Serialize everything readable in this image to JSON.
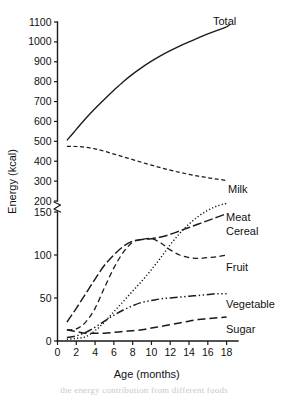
{
  "chart_data": {
    "type": "line",
    "title": "",
    "xlabel": "Age (months)",
    "ylabel": "Energy (kcal)",
    "xlim": [
      0,
      19
    ],
    "xticks": [
      0,
      2,
      4,
      6,
      8,
      10,
      12,
      14,
      16,
      18
    ],
    "xtick_labels": [
      "0",
      "2",
      "4",
      "6",
      "8",
      "10",
      "12",
      "14",
      "16",
      "18"
    ],
    "ylim_lower": [
      0,
      150
    ],
    "ylim_upper": [
      200,
      1100
    ],
    "yticks_lower": [
      0,
      50,
      100,
      150
    ],
    "yticks_upper": [
      200,
      300,
      400,
      500,
      600,
      700,
      800,
      900,
      1000,
      1100
    ],
    "ytick_labels": [
      "0",
      "50",
      "100",
      "150",
      "200",
      "300",
      "400",
      "500",
      "600",
      "700",
      "800",
      "900",
      "1000",
      "1100"
    ],
    "axis_break": true,
    "axis_break_between": [
      150,
      200
    ],
    "grid": false,
    "legend_position": "right-of-curve-ends",
    "x": [
      1,
      2,
      3,
      4,
      5,
      6,
      7,
      8,
      9,
      10,
      11,
      12,
      13,
      14,
      15,
      16,
      17,
      18
    ],
    "series": [
      {
        "name": "Total",
        "label": "Total",
        "line_style": "solid",
        "values": [
          505,
          560,
          615,
          665,
          712,
          757,
          800,
          838,
          872,
          903,
          931,
          956,
          979,
          1000,
          1020,
          1040,
          1058,
          1075
        ]
      },
      {
        "name": "Milk",
        "label": "Milk",
        "line_style": "dashed-short",
        "values": [
          475,
          474,
          470,
          462,
          450,
          436,
          422,
          408,
          394,
          380,
          367,
          355,
          344,
          334,
          325,
          317,
          310,
          303
        ]
      },
      {
        "name": "Meat",
        "label": "Meat",
        "line_style": "dotted",
        "values": [
          2,
          3,
          5,
          12,
          22,
          34,
          46,
          58,
          70,
          83,
          97,
          112,
          125,
          136,
          145,
          152,
          157,
          160
        ]
      },
      {
        "name": "Cereal",
        "label": "Cereal",
        "line_style": "dash-dot",
        "values": [
          22,
          38,
          55,
          72,
          88,
          100,
          110,
          116,
          118,
          119,
          121,
          124,
          128,
          132,
          136,
          140,
          144,
          148
        ]
      },
      {
        "name": "Fruit",
        "label": "Fruit",
        "line_style": "dashed",
        "values": [
          13,
          14,
          22,
          38,
          62,
          85,
          103,
          115,
          118,
          119,
          114,
          106,
          100,
          97,
          96,
          97,
          98,
          100
        ]
      },
      {
        "name": "Vegetable",
        "label": "Vegetable",
        "line_style": "dash-dot-dot",
        "values": [
          4,
          6,
          10,
          16,
          23,
          30,
          36,
          41,
          45,
          47,
          49,
          50,
          51,
          52,
          53,
          54,
          55,
          55
        ]
      },
      {
        "name": "Sugar",
        "label": "Sugar",
        "line_style": "long-dash",
        "values": [
          13,
          11,
          9,
          9,
          9,
          10,
          11,
          12,
          13,
          15,
          17,
          19,
          21,
          23,
          25,
          26,
          27,
          28
        ]
      }
    ]
  },
  "caption": {
    "partial_line": "the energy contribution from different foods"
  }
}
